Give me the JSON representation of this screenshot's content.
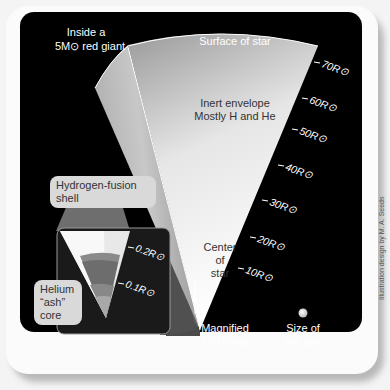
{
  "figure": {
    "title_line1": "Inside a",
    "title_line2": "5M⊙ red giant",
    "surface_label": "Surface of star",
    "envelope_line1": "Inert envelope",
    "envelope_line2": "Mostly H and He",
    "center_line1": "Center",
    "center_line2": "of",
    "center_line3": "star",
    "magnified_line1": "Magnified",
    "magnified_line2": "100 times",
    "sun_line1": "Size of",
    "sun_line2": "the sun",
    "shell_line1": "Hydrogen-fusion",
    "shell_line2": "shell",
    "core_line1": "Helium",
    "core_line2": "“ash”",
    "core_line3": "core",
    "credit": "Illustration design by M. A. Seeds",
    "radius_ticks": [
      "70R⊙",
      "60R⊙",
      "50R⊙",
      "40R⊙",
      "30R⊙",
      "20R⊙",
      "10R⊙"
    ],
    "inset_ticks": [
      "0.2R⊙",
      "0.1R⊙"
    ]
  },
  "colors": {
    "background": "#000000",
    "envelope_light": "#f5f5f5",
    "envelope_dark": "#8a8a8a",
    "callout": "#d9d9d9"
  }
}
